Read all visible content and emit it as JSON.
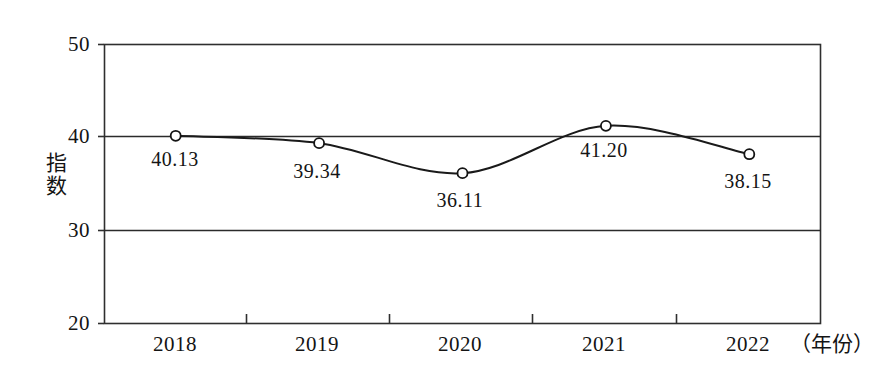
{
  "chart_data": {
    "type": "line",
    "title": "",
    "xlabel": "（年份）",
    "ylabel": "指数",
    "categories": [
      "2018",
      "2019",
      "2020",
      "2021",
      "2022"
    ],
    "values": [
      40.13,
      39.34,
      36.11,
      41.2,
      38.15
    ],
    "point_labels": [
      "40.13",
      "39.34",
      "36.11",
      "41.20",
      "38.15"
    ],
    "ylim": [
      20,
      50
    ],
    "yticks": [
      50,
      40,
      30,
      20
    ],
    "ytick_labels": [
      "50",
      "40",
      "30",
      "20"
    ],
    "gridlines": [
      40,
      30
    ],
    "grid": true,
    "legend": null,
    "legend_position": "none",
    "marker": "open-circle",
    "line_style": "smooth-spline",
    "series": [
      {
        "name": "指数",
        "values": [
          40.13,
          39.34,
          36.11,
          41.2,
          38.15
        ]
      }
    ]
  },
  "colors": {
    "line": "#1a1a1a",
    "axis": "#333333",
    "grid": "#2b2b2b",
    "marker_fill": "#ffffff",
    "marker_stroke": "#141414",
    "background": "#ffffff",
    "text": "#141414"
  }
}
